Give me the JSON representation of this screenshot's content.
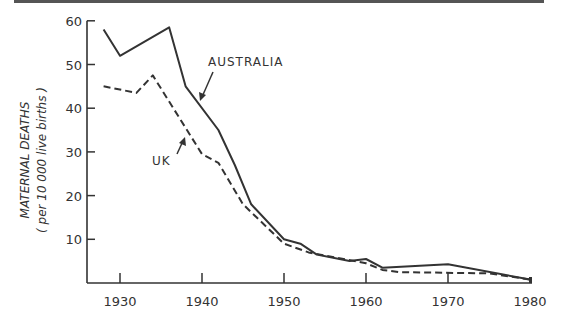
{
  "chart_data": {
    "type": "line",
    "title": "",
    "xlabel": "",
    "ylabel": "MATERNAL DEATHS",
    "ylabel_sub": "( per 10 000 live births )",
    "xlim": [
      1926,
      1981
    ],
    "ylim": [
      0,
      60
    ],
    "x_ticks": [
      1930,
      1940,
      1950,
      1960,
      1970,
      1980
    ],
    "x_tick_labels": [
      "1930",
      "1940",
      "1950",
      "1960",
      "1970",
      "1980"
    ],
    "y_ticks": [
      10,
      20,
      30,
      40,
      50,
      60
    ],
    "y_tick_labels": [
      "10",
      "20",
      "30",
      "40",
      "50",
      "60"
    ],
    "grid": false,
    "legend": "inline annotations with arrows",
    "series": [
      {
        "name": "AUSTRALIA",
        "style": "solid",
        "points": [
          [
            1928,
            58
          ],
          [
            1930,
            52
          ],
          [
            1936,
            58.5
          ],
          [
            1938,
            45
          ],
          [
            1942,
            35
          ],
          [
            1944,
            27
          ],
          [
            1946,
            18
          ],
          [
            1950,
            10
          ],
          [
            1952,
            9
          ],
          [
            1954,
            6.5
          ],
          [
            1958,
            5
          ],
          [
            1960,
            5.5
          ],
          [
            1962,
            3.5
          ],
          [
            1970,
            4.3
          ],
          [
            1980,
            0.8
          ]
        ]
      },
      {
        "name": "UK",
        "style": "dashed",
        "points": [
          [
            1928,
            45
          ],
          [
            1932,
            43.5
          ],
          [
            1934,
            47.5
          ],
          [
            1940,
            29.5
          ],
          [
            1942,
            27.5
          ],
          [
            1945,
            18
          ],
          [
            1950,
            9
          ],
          [
            1953,
            7
          ],
          [
            1960,
            4.5
          ],
          [
            1962,
            3
          ],
          [
            1964,
            2.5
          ],
          [
            1975,
            2.2
          ],
          [
            1980,
            0.8
          ]
        ]
      }
    ],
    "annotations": [
      {
        "text": "AUSTRALIA",
        "target_series": "AUSTRALIA"
      },
      {
        "text": "UK",
        "target_series": "UK"
      }
    ]
  },
  "labels": {
    "ylabel_main": "MATERNAL DEATHS",
    "ylabel_sub": "( per 10 000 live births )",
    "ann_australia": "AUSTRALIA",
    "ann_uk": "UK"
  },
  "colors": {
    "ink": "#333333",
    "background": "#ffffff"
  }
}
